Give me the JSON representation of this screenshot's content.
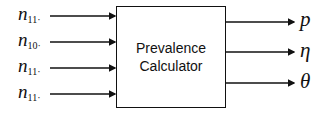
{
  "diagram": {
    "block": {
      "line1": "Prevalence",
      "line2": "Calculator"
    },
    "inputs": [
      {
        "symbol": "n",
        "subscript": "11·",
        "y": 16
      },
      {
        "symbol": "n",
        "subscript": "10·",
        "y": 42
      },
      {
        "symbol": "n",
        "subscript": "11·",
        "y": 68
      },
      {
        "symbol": "n",
        "subscript": "11·",
        "y": 94
      }
    ],
    "outputs": [
      {
        "symbol": "p",
        "y": 22
      },
      {
        "symbol": "η",
        "y": 52
      },
      {
        "symbol": "θ",
        "y": 83
      }
    ]
  }
}
